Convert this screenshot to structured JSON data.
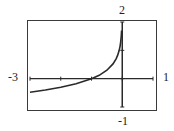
{
  "chart_data": {
    "type": "line",
    "title": "",
    "xlabel": "",
    "ylabel": "",
    "xlim": [
      -3,
      1
    ],
    "ylim": [
      -1,
      2
    ],
    "grid": false,
    "legend": null,
    "tick_labels": {
      "x_min": "-3",
      "x_max": "1",
      "y_max": "2",
      "y_min": "-1"
    },
    "x_ticks": [
      -3,
      -2,
      -1,
      0,
      1
    ],
    "y_ticks": [
      -1,
      0,
      1,
      2
    ],
    "series": [
      {
        "name": "curve",
        "x": [
          -3,
          -2.5,
          -2,
          -1.5,
          -1,
          -0.75,
          -0.5,
          -0.3,
          -0.2,
          -0.15,
          -0.1,
          -0.07,
          -0.05,
          -0.03,
          -0.02
        ],
        "y": [
          -0.48,
          -0.4,
          -0.3,
          -0.18,
          0,
          0.12,
          0.3,
          0.52,
          0.7,
          0.82,
          1.0,
          1.15,
          1.3,
          1.52,
          1.7
        ]
      }
    ],
    "vertical_asymptote_x": 0
  },
  "labels": {
    "x_min": "-3",
    "x_max": "1",
    "y_max": "2",
    "y_min": "-1"
  }
}
